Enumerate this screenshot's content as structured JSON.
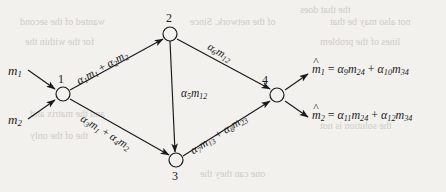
{
  "figure": {
    "type": "directed-network-graph",
    "background_color": "#f2f1ee",
    "ink_color": "#1a1a1a",
    "nodes": [
      {
        "id": "1",
        "label": "1",
        "cx": 63,
        "cy": 94,
        "r": 7
      },
      {
        "id": "2",
        "label": "2",
        "cx": 170,
        "cy": 34,
        "r": 7
      },
      {
        "id": "3",
        "label": "3",
        "cx": 176,
        "cy": 160,
        "r": 7
      },
      {
        "id": "4",
        "label": "4",
        "cx": 277,
        "cy": 95,
        "r": 7
      }
    ],
    "inputs": [
      {
        "name": "m1",
        "label": "m",
        "sub": "1"
      },
      {
        "name": "m2",
        "label": "m",
        "sub": "2"
      }
    ],
    "outputs": [
      {
        "name": "m-hat-1",
        "lhs_base": "m",
        "lhs_sub": "1",
        "eq": "=",
        "t1_coef": "α",
        "t1_coef_sub": "9",
        "t1_var": "m",
        "t1_var_sub": "24",
        "plus": "+",
        "t2_coef": "α",
        "t2_coef_sub": "10",
        "t2_var": "m",
        "t2_var_sub": "34"
      },
      {
        "name": "m-hat-2",
        "lhs_base": "m",
        "lhs_sub": "2",
        "eq": "=",
        "t1_coef": "α",
        "t1_coef_sub": "11",
        "t1_var": "m",
        "t1_var_sub": "24",
        "plus": "+",
        "t2_coef": "α",
        "t2_coef_sub": "12",
        "t2_var": "m",
        "t2_var_sub": "34"
      }
    ],
    "edges": [
      {
        "name": "edge-1-2",
        "from": "1",
        "to": "2",
        "angle": -29.5,
        "label": {
          "c1": "α",
          "c1s": "1",
          "v1": "m",
          "v1s": "1",
          "plus": "+",
          "c2": "α",
          "c2s": "2",
          "v2": "m",
          "v2s": "2"
        }
      },
      {
        "name": "edge-1-3",
        "from": "1",
        "to": "3",
        "angle": 31.5,
        "label": {
          "c1": "α",
          "c1s": "3",
          "v1": "m",
          "v1s": "1",
          "plus": "+",
          "c2": "α",
          "c2s": "4",
          "v2": "m",
          "v2s": "2"
        }
      },
      {
        "name": "edge-2-3",
        "from": "2",
        "to": "3",
        "angle": 0,
        "label": {
          "c1": "α",
          "c1s": "5",
          "v1": "m",
          "v1s": "12"
        }
      },
      {
        "name": "edge-2-4",
        "from": "2",
        "to": "4",
        "angle": 30.5,
        "label": {
          "c1": "α",
          "c1s": "6",
          "v1": "m",
          "v1s": "12"
        }
      },
      {
        "name": "edge-3-4",
        "from": "3",
        "to": "4",
        "angle": -32.5,
        "label": {
          "c1": "α",
          "c1s": "7",
          "v1": "m",
          "v1s": "13",
          "plus": "+",
          "c2": "α",
          "c2s": "8",
          "v2": "m",
          "v2s": "23"
        }
      }
    ],
    "bleed_through_text": [
      "the that does",
      "wanted of the second",
      "of the network. Since",
      "not also may be that",
      "for the within the",
      "lines of the problem",
      "and the matrix and",
      "the solution is not",
      "the of the only",
      "one can they the"
    ]
  }
}
